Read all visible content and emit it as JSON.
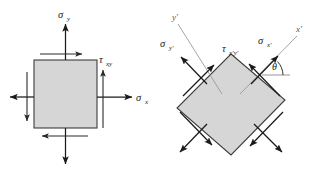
{
  "figure": {
    "background_color": "#ffffff",
    "body_fill_color": "#d6d6d6",
    "body_stroke_color": "#3d3d3d",
    "arrow_color": "#1a1a1a",
    "axis_color": "#9a9a9a"
  },
  "left_element": {
    "name": "unrotated-stress-element",
    "shape": "square",
    "labels": {
      "sigma_y": {
        "symbol": "σ",
        "subscript": "y"
      },
      "sigma_x": {
        "symbol": "σ",
        "subscript": "x"
      },
      "tau_xy": {
        "symbol": "τ",
        "subscript": "xy"
      }
    },
    "stresses": [
      {
        "name": "sigma-y-top",
        "type": "normal",
        "direction": "up",
        "face": "top"
      },
      {
        "name": "sigma-y-bottom",
        "type": "normal",
        "direction": "down",
        "face": "bottom"
      },
      {
        "name": "sigma-x-right",
        "type": "normal",
        "direction": "right",
        "face": "right"
      },
      {
        "name": "sigma-x-left",
        "type": "normal",
        "direction": "left",
        "face": "left"
      },
      {
        "name": "tau-xy-top",
        "type": "shear",
        "direction": "right",
        "face": "top"
      },
      {
        "name": "tau-xy-bottom",
        "type": "shear",
        "direction": "left",
        "face": "bottom"
      },
      {
        "name": "tau-xy-right",
        "type": "shear",
        "direction": "up",
        "face": "right"
      },
      {
        "name": "tau-xy-left",
        "type": "shear",
        "direction": "down",
        "face": "left"
      }
    ]
  },
  "right_element": {
    "name": "rotated-stress-element",
    "shape": "square-rotated-45",
    "rotation_note": "element rotated by angle theta",
    "labels": {
      "sigma_x_prime": {
        "symbol": "σ",
        "subscript": "x′"
      },
      "sigma_y_prime": {
        "symbol": "σ",
        "subscript": "y′"
      },
      "tau_xprime_yprime": {
        "symbol": "τ",
        "subscript": "x′y′"
      },
      "theta": {
        "symbol": "θ"
      },
      "axis_x_prime": "x′",
      "axis_y_prime": "y′"
    },
    "stresses": [
      {
        "name": "sigma-xprime-upper-right",
        "type": "normal",
        "direction": "up-right",
        "face": "upper-right"
      },
      {
        "name": "sigma-xprime-lower-left",
        "type": "normal",
        "direction": "down-left",
        "face": "lower-left"
      },
      {
        "name": "sigma-yprime-upper-left",
        "type": "normal",
        "direction": "up-left",
        "face": "upper-left"
      },
      {
        "name": "sigma-yprime-lower-right",
        "type": "normal",
        "direction": "down-right",
        "face": "lower-right"
      },
      {
        "name": "tau-xprime-yprime-upper-right",
        "type": "shear",
        "direction": "up-left",
        "face": "upper-right"
      },
      {
        "name": "tau-xprime-yprime-upper-left",
        "type": "shear",
        "direction": "up-right",
        "face": "upper-left"
      },
      {
        "name": "tau-xprime-yprime-lower-left",
        "type": "shear",
        "direction": "down-right",
        "face": "lower-left"
      },
      {
        "name": "tau-xprime-yprime-lower-right",
        "type": "shear",
        "direction": "down-left",
        "face": "lower-right"
      }
    ]
  }
}
